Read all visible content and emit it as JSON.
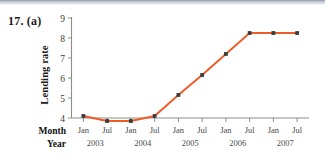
{
  "figure": {
    "number_label": "17. (a)"
  },
  "axis_labels": {
    "y_title": "Lending rate",
    "row_month": "Month",
    "row_year": "Year"
  },
  "chart_data": {
    "type": "line",
    "title": "",
    "xlabel": "",
    "ylabel": "Lending rate",
    "ylim": [
      3.5,
      9
    ],
    "yticks": [
      4,
      5,
      6,
      7,
      8,
      9
    ],
    "grid": false,
    "legend": "none",
    "line_color": "#ef5b25",
    "marker_color": "#3b3b3b",
    "categories": [
      "Jan",
      "Jul",
      "Jan",
      "Jul",
      "Jan",
      "Jul",
      "Jan",
      "Jul",
      "Jan",
      "Jul"
    ],
    "years": [
      "2003",
      "2003",
      "2004",
      "2004",
      "2005",
      "2005",
      "2006",
      "2006",
      "2007",
      "2007"
    ],
    "year_groups": [
      "2003",
      "2004",
      "2005",
      "2006",
      "2007"
    ],
    "x": [
      "Jan 2003",
      "Jul 2003",
      "Jan 2004",
      "Jul 2004",
      "Jan 2005",
      "Jul 2005",
      "Jan 2006",
      "Jul 2006",
      "Jan 2007",
      "Jul 2007"
    ],
    "values": [
      4.1,
      3.85,
      3.85,
      4.1,
      5.15,
      6.15,
      7.2,
      8.25,
      8.25,
      8.25
    ],
    "series": [
      {
        "name": "Lending rate",
        "values": [
          4.1,
          3.85,
          3.85,
          4.1,
          5.15,
          6.15,
          7.2,
          8.25,
          8.25,
          8.25
        ]
      }
    ]
  },
  "ticks": {
    "y": [
      "9",
      "8",
      "7",
      "6",
      "5",
      "4"
    ],
    "x_months": [
      "Jan",
      "Jul",
      "Jan",
      "Jul",
      "Jan",
      "Jul",
      "Jan",
      "Jul",
      "Jan",
      "Jul"
    ],
    "x_years": [
      "2003",
      "2004",
      "2005",
      "2006",
      "2007"
    ]
  }
}
